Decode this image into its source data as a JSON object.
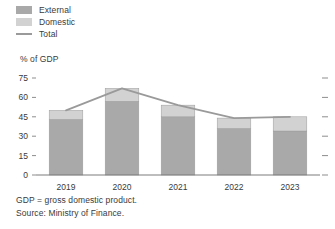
{
  "legend": {
    "items": [
      {
        "label": "External",
        "type": "swatch",
        "color": "#a9a9a9",
        "icon": "square-swatch-icon"
      },
      {
        "label": "Domestic",
        "type": "swatch",
        "color": "#d2d2d2",
        "icon": "square-swatch-icon"
      },
      {
        "label": "Total",
        "type": "line",
        "color": "#9a9a9a",
        "icon": "line-swatch-icon"
      }
    ]
  },
  "footnotes": [
    "GDP = gross domestic product.",
    "Source: Ministry of Finance."
  ],
  "colors": {
    "external": "#a9a9a9",
    "domestic": "#d2d2d2",
    "total_line": "#9a9a9a",
    "axis": "#7d7d7d",
    "text": "#3a3a3a"
  },
  "chart_data": {
    "type": "bar",
    "title": "",
    "subtitle": "",
    "xlabel": "",
    "ylabel": "% of GDP",
    "categories": [
      "2019",
      "2020",
      "2021",
      "2022",
      "2023"
    ],
    "ylim": [
      0,
      75
    ],
    "yticks": [
      0,
      15,
      30,
      45,
      60,
      75
    ],
    "ytick_labels": [
      "0",
      "15",
      "30",
      "45",
      "60",
      "75"
    ],
    "grid": false,
    "legend_position": "top-left",
    "stacked": true,
    "series": [
      {
        "name": "External",
        "values": [
          43,
          57,
          45,
          36,
          34
        ],
        "color": "#a9a9a9",
        "kind": "bar"
      },
      {
        "name": "Domestic",
        "values": [
          7,
          10,
          9,
          8,
          11
        ],
        "color": "#d2d2d2",
        "kind": "bar"
      },
      {
        "name": "Total",
        "values": [
          50,
          67,
          54,
          44,
          45
        ],
        "color": "#9a9a9a",
        "kind": "line"
      }
    ]
  }
}
